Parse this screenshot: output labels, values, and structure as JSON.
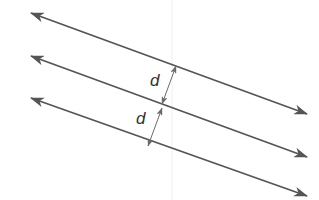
{
  "diagram": {
    "colors": {
      "line": "#555555",
      "dimension": "#6a6a6a",
      "label": "#333333",
      "artifact": "#f0f0f0",
      "background": "#ffffff"
    },
    "lines": [
      {
        "id": "line-1",
        "x1": 31,
        "y1": 13,
        "x2": 307,
        "y2": 114,
        "arrows": "both"
      },
      {
        "id": "line-2",
        "x1": 31,
        "y1": 56,
        "x2": 307,
        "y2": 157,
        "arrows": "both"
      },
      {
        "id": "line-3",
        "x1": 31,
        "y1": 98,
        "x2": 307,
        "y2": 196,
        "arrows": "both"
      }
    ],
    "dimensions": [
      {
        "id": "distance-1",
        "x1": 176,
        "y1": 66,
        "x2": 162,
        "y2": 104,
        "label": "d",
        "label_x": 150,
        "label_y": 72
      },
      {
        "id": "distance-2",
        "x1": 162,
        "y1": 108,
        "x2": 148,
        "y2": 146,
        "label": "d",
        "label_x": 136,
        "label_y": 110
      }
    ]
  }
}
